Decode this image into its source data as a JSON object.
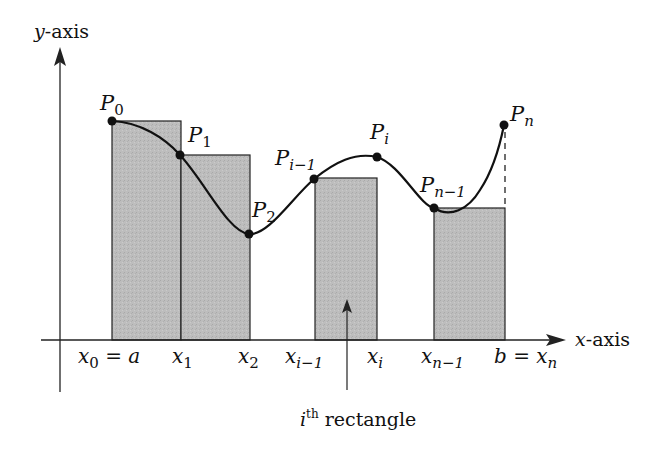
{
  "figure": {
    "axes": {
      "x_label_var": "x",
      "x_label_rest": "-axis",
      "y_label_var": "y",
      "y_label_rest": "-axis"
    },
    "points": [
      {
        "name": "P",
        "sub": "0",
        "x": 112,
        "y": 121
      },
      {
        "name": "P",
        "sub": "1",
        "x": 180,
        "y": 155
      },
      {
        "name": "P",
        "sub": "2",
        "x": 249,
        "y": 234
      },
      {
        "name": "P",
        "sub": "i−1",
        "x": 314,
        "y": 179
      },
      {
        "name": "P",
        "sub": "i",
        "x": 377,
        "y": 157
      },
      {
        "name": "P",
        "sub": "n−1",
        "x": 434,
        "y": 208
      },
      {
        "name": "P",
        "sub": "n",
        "x": 504,
        "y": 125
      }
    ],
    "ticks": [
      {
        "var": "x",
        "sub": "0",
        "rest": " = a"
      },
      {
        "var": "x",
        "sub": "1",
        "rest": ""
      },
      {
        "var": "x",
        "sub": "2",
        "rest": ""
      },
      {
        "var": "x",
        "sub": "i−1",
        "rest": ""
      },
      {
        "var": "x",
        "sub": "i",
        "rest": ""
      },
      {
        "var": "x",
        "sub": "n−1",
        "rest": ""
      },
      {
        "pre": "b = ",
        "var": "x",
        "sub": "n"
      }
    ],
    "rectangles": [
      {
        "x0": 112,
        "x1": 181,
        "top": 121
      },
      {
        "x0": 181,
        "x1": 250,
        "top": 155
      },
      {
        "x0": 315,
        "x1": 377,
        "top": 178
      },
      {
        "x0": 434,
        "x1": 505,
        "top": 208
      }
    ],
    "annotation": {
      "var": "i",
      "sup": "th",
      "text": " rectangle"
    },
    "colors": {
      "fill": "#b9b9b9",
      "line": "#111111"
    }
  }
}
